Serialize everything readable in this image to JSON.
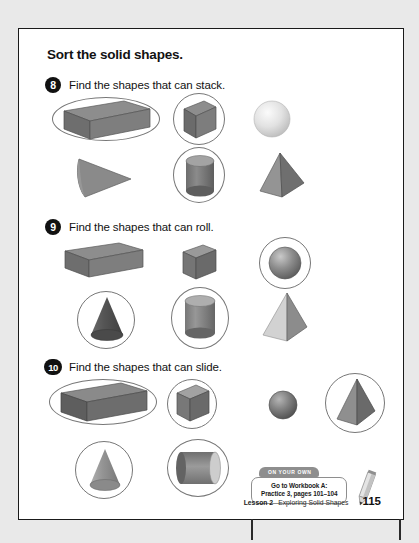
{
  "page": {
    "title": "Sort the solid shapes.",
    "number": "115",
    "footer_lesson": "Lesson 2",
    "footer_title": "Exploring Solid Shapes"
  },
  "questions": [
    {
      "number": "8",
      "prompt": "Find the shapes that can stack.",
      "shapes": [
        {
          "name": "rectangular-prism",
          "circled": true
        },
        {
          "name": "cube",
          "circled": true
        },
        {
          "name": "sphere",
          "circled": false
        },
        {
          "name": "cone-sideways",
          "circled": false
        },
        {
          "name": "cylinder",
          "circled": true
        },
        {
          "name": "pyramid",
          "circled": false
        }
      ]
    },
    {
      "number": "9",
      "prompt": "Find the shapes that can roll.",
      "shapes": [
        {
          "name": "rectangular-prism",
          "circled": false
        },
        {
          "name": "cube",
          "circled": false
        },
        {
          "name": "sphere",
          "circled": true
        },
        {
          "name": "cone",
          "circled": true
        },
        {
          "name": "cylinder",
          "circled": true
        },
        {
          "name": "pyramid",
          "circled": false
        }
      ]
    },
    {
      "number": "10",
      "prompt": "Find the shapes that can slide.",
      "shapes": [
        {
          "name": "rectangular-prism",
          "circled": true
        },
        {
          "name": "cube",
          "circled": true
        },
        {
          "name": "sphere",
          "circled": false
        },
        {
          "name": "pyramid",
          "circled": true
        },
        {
          "name": "cone",
          "circled": true
        },
        {
          "name": "cylinder-sideways",
          "circled": true
        }
      ]
    }
  ],
  "callout": {
    "tab_label": "ON YOUR OWN",
    "line1": "Go to Workbook A:",
    "line2": "Practice 3, pages 101–104"
  },
  "colors": {
    "page_background": "#ffffff",
    "outer_background": "#e9e9e9",
    "ink": "#121212",
    "ring_stroke": "#777777",
    "callout_accent": "#8e8e8e"
  }
}
